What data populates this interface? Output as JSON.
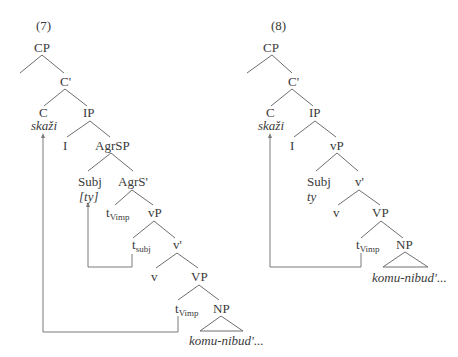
{
  "diagrams": [
    {
      "number": "(7)",
      "nodes": {
        "cp": "CP",
        "c_bar": "C'",
        "c": "C",
        "c_word": "skaži",
        "ip": "IP",
        "i": "I",
        "agrsp": "AgrSP",
        "subj": "Subj",
        "subj_word": "[ty]",
        "agrs_bar": "AgrS'",
        "t_vimp_1_base": "t",
        "t_vimp_1_sub": "Vimp",
        "vp_small": "vP",
        "t_subj_base": "t",
        "t_subj_sub": "subj",
        "v_bar": "v'",
        "v": "v",
        "vp": "VP",
        "t_vimp_2_base": "t",
        "t_vimp_2_sub": "Vimp",
        "np": "NP",
        "np_word": "komu-nibud'..."
      }
    },
    {
      "number": "(8)",
      "nodes": {
        "cp": "CP",
        "c_bar": "C'",
        "c": "C",
        "c_word": "skaži",
        "ip": "IP",
        "i": "I",
        "vp_small": "vP",
        "subj": "Subj",
        "subj_word": "ty",
        "v_bar": "v'",
        "v": "v",
        "vp": "VP",
        "t_vimp_base": "t",
        "t_vimp_sub": "Vimp",
        "np": "NP",
        "np_word": "komu-nibud'..."
      }
    }
  ],
  "colors": {
    "text": "#3a3a3a",
    "lines": "#6e6e6e",
    "background": "#ffffff"
  }
}
